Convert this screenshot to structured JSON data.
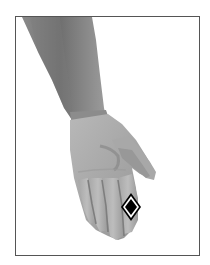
{
  "figure": {
    "frame": {
      "border_color": "#555555",
      "background": "#ffffff"
    },
    "illustration": {
      "subject": "arm-and-hand-palm-view",
      "skin_tone_dark": "#6e6e6e",
      "skin_tone_mid": "#9a9a9a",
      "skin_tone_light": "#c4c4c4"
    },
    "marker": {
      "icon": "diamond-marker-icon",
      "fill": "#000000",
      "outline": "#ffffff",
      "stroke": "#000000"
    }
  }
}
